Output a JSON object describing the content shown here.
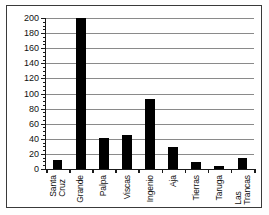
{
  "chart_data": {
    "type": "bar",
    "title": "",
    "xlabel": "",
    "ylabel": "",
    "categories": [
      "Santa\nCruz",
      "Grande",
      "Palpa",
      "Viscas",
      "Ingenio",
      "Aja",
      "Tierras",
      "Taruga",
      "Las\nTrancas"
    ],
    "values": [
      12,
      200,
      41,
      45,
      93,
      29,
      9,
      4,
      14
    ],
    "ylim": [
      0,
      200
    ],
    "yticks": [
      0,
      20,
      40,
      60,
      80,
      100,
      120,
      140,
      160,
      180,
      200
    ],
    "ytick_labels": [
      "0",
      "20",
      "40",
      "60",
      "80",
      "100",
      "120",
      "140",
      "160",
      "180",
      "200"
    ],
    "y_minor_step": 5,
    "grid": true,
    "grid_axis": "y",
    "legend": false,
    "bar_color": "#000000",
    "grid_color": "#8a8a8a",
    "axis_color": "#1a1a1a"
  }
}
